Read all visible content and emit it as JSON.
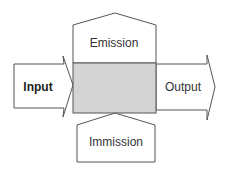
{
  "diagram": {
    "input_label": "Input",
    "output_label": "Output",
    "emission_label": "Emission",
    "immission_label": "Immission",
    "colors": {
      "stroke": "#555555",
      "box_fill": "#d4d4d4",
      "background": "#ffffff"
    }
  }
}
